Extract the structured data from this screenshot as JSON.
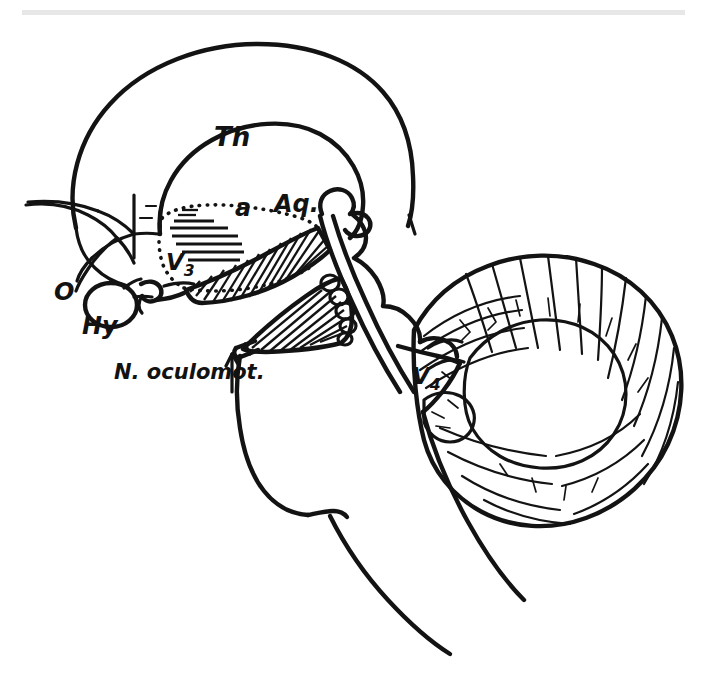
{
  "figure": {
    "kind": "anatomical-line-drawing",
    "background_color": "#ffffff",
    "ink_color": "#131313",
    "scan_artifact_color": "#e3e3e3"
  },
  "labels": {
    "thalamus": "Th",
    "adhesio": "a",
    "aqueduct": "Aq.",
    "third_ventricle_main": "V",
    "third_ventricle_sub": "3",
    "fourth_ventricle_main": "V",
    "fourth_ventricle_sub": "4",
    "optic_chiasm": "O",
    "hypophysis": "Hy",
    "oculomotor_nerve": "N. oculomot."
  },
  "regions": [
    {
      "name": "cerebral-hemisphere-outline",
      "label": ""
    },
    {
      "name": "thalamus-outline",
      "label": "Th"
    },
    {
      "name": "third-ventricle",
      "label": "V3"
    },
    {
      "name": "cerebral-aqueduct",
      "label": "Aq."
    },
    {
      "name": "fourth-ventricle",
      "label": "V4"
    },
    {
      "name": "optic-chiasm",
      "label": "O"
    },
    {
      "name": "hypophysis",
      "label": "Hy"
    },
    {
      "name": "oculomotor-nerve",
      "label": "N. oculomot."
    },
    {
      "name": "cerebellum",
      "label": ""
    },
    {
      "name": "pons",
      "label": ""
    },
    {
      "name": "medulla-oblongata",
      "label": ""
    },
    {
      "name": "midbrain-tegmentum",
      "label": ""
    },
    {
      "name": "mammillary-body",
      "label": ""
    }
  ]
}
